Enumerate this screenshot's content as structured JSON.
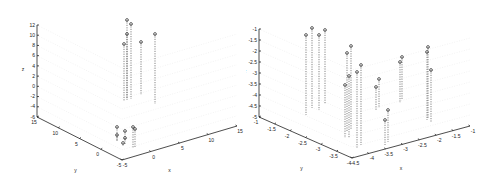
{
  "chart_data": [
    {
      "type": "scatter",
      "subtype": "stem3",
      "title": "",
      "xlabel": "x",
      "ylabel": "y",
      "zlabel": "z",
      "x_ticks": [
        "-5",
        "0",
        "5",
        "10",
        "15"
      ],
      "y_ticks": [
        "-5",
        "0",
        "5",
        "10",
        "15"
      ],
      "z_ticks": [
        "-6",
        "-4",
        "-2",
        "0",
        "2",
        "4",
        "6",
        "8",
        "10",
        "12"
      ],
      "xlim": [
        -5,
        15
      ],
      "ylim": [
        -5,
        15
      ],
      "zlim": [
        -6,
        12
      ],
      "grid": true,
      "stems_screen": [
        {
          "x": 127,
          "top": 20,
          "bottom": 100
        },
        {
          "x": 131,
          "top": 24,
          "bottom": 99
        },
        {
          "x": 127,
          "top": 34,
          "bottom": 99
        },
        {
          "x": 124,
          "top": 44,
          "bottom": 101
        },
        {
          "x": 141,
          "top": 42,
          "bottom": 95
        },
        {
          "x": 155,
          "top": 34,
          "bottom": 104
        },
        {
          "x": 117,
          "top": 127,
          "bottom": 140
        },
        {
          "x": 117,
          "top": 135,
          "bottom": 142
        },
        {
          "x": 125,
          "top": 131,
          "bottom": 140
        },
        {
          "x": 125,
          "top": 138,
          "bottom": 145
        },
        {
          "x": 123,
          "top": 143,
          "bottom": 146
        },
        {
          "x": 133,
          "top": 127,
          "bottom": 148
        },
        {
          "x": 135,
          "top": 129,
          "bottom": 148
        }
      ]
    },
    {
      "type": "scatter",
      "subtype": "stem3",
      "title": "",
      "xlabel": "x",
      "ylabel": "y",
      "zlabel": "z",
      "x_ticks": [
        "-4.5",
        "-4",
        "-3.5",
        "-3",
        "-2.5",
        "-2",
        "-1.5",
        "-1"
      ],
      "y_ticks": [
        "-4",
        "-3.5",
        "-3",
        "-2.5",
        "-2",
        "-1.5",
        "-1"
      ],
      "z_ticks": [
        "-5",
        "-4.5",
        "-4",
        "-3.5",
        "-3",
        "-2.5",
        "-2",
        "-1.5",
        "-1"
      ],
      "xlim": [
        -4.5,
        -1
      ],
      "ylim": [
        -4,
        -1
      ],
      "zlim": [
        -5,
        -1
      ],
      "grid": true,
      "stems_screen": [
        {
          "x": 60,
          "top": 35,
          "bottom": 115
        },
        {
          "x": 66,
          "top": 28,
          "bottom": 108
        },
        {
          "x": 73,
          "top": 35,
          "bottom": 110
        },
        {
          "x": 79,
          "top": 30,
          "bottom": 104
        },
        {
          "x": 101,
          "top": 53,
          "bottom": 132
        },
        {
          "x": 105,
          "top": 46,
          "bottom": 130
        },
        {
          "x": 99,
          "top": 85,
          "bottom": 138
        },
        {
          "x": 103,
          "top": 76,
          "bottom": 138
        },
        {
          "x": 111,
          "top": 72,
          "bottom": 148
        },
        {
          "x": 115,
          "top": 65,
          "bottom": 145
        },
        {
          "x": 130,
          "top": 87,
          "bottom": 110
        },
        {
          "x": 133,
          "top": 79,
          "bottom": 108
        },
        {
          "x": 139,
          "top": 120,
          "bottom": 145
        },
        {
          "x": 142,
          "top": 110,
          "bottom": 142
        },
        {
          "x": 154,
          "top": 62,
          "bottom": 103
        },
        {
          "x": 156,
          "top": 57,
          "bottom": 100
        },
        {
          "x": 181,
          "top": 52,
          "bottom": 120
        },
        {
          "x": 182,
          "top": 47,
          "bottom": 118
        },
        {
          "x": 185,
          "top": 70,
          "bottom": 122
        }
      ]
    }
  ],
  "left": {
    "xlabel": "x",
    "ylabel": "y",
    "zlabel": "z"
  },
  "right": {
    "xlabel": "x",
    "ylabel": "y",
    "zlabel": "z"
  }
}
